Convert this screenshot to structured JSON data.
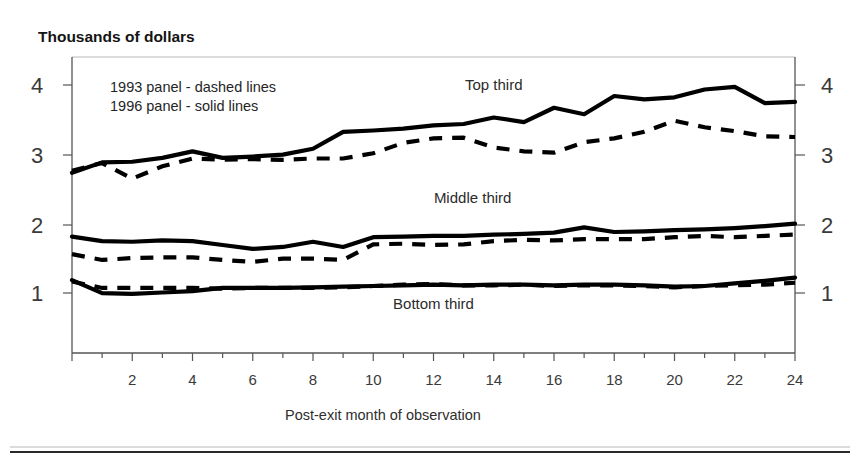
{
  "chart_data": {
    "type": "line",
    "title": "",
    "ylabel": "Thousands of dollars",
    "xlabel": "Post-exit month of observation",
    "xlim": [
      0,
      24
    ],
    "ylim": [
      0,
      4.55
    ],
    "grid": false,
    "legend_position": "inside-top-left",
    "xticks": [
      2,
      4,
      6,
      8,
      10,
      12,
      14,
      16,
      18,
      20,
      22,
      24
    ],
    "xtick_labels": [
      "2",
      "4",
      "6",
      "8",
      "10",
      "12",
      "14",
      "16",
      "18",
      "20",
      "22",
      "24"
    ],
    "yticks": [
      1,
      2,
      3,
      4
    ],
    "ytick_labels": [
      "1",
      "2",
      "3",
      "4"
    ],
    "ytick_labels_right": [
      "1",
      "2",
      "3",
      "4"
    ],
    "x": [
      0,
      1,
      2,
      3,
      4,
      5,
      6,
      7,
      8,
      9,
      10,
      11,
      12,
      13,
      14,
      15,
      16,
      17,
      18,
      19,
      20,
      21,
      22,
      23,
      24
    ],
    "annotations": [
      {
        "text": "Top third",
        "x": 14.0,
        "y": 4.05
      },
      {
        "text": "Middle third",
        "x": 13.3,
        "y": 2.3
      },
      {
        "text": "Bottom third",
        "x": 12.0,
        "y": 0.68
      }
    ],
    "legend_entries": [
      "1993 panel - dashed lines",
      "1996 panel - solid lines"
    ],
    "series": [
      {
        "name": "Top third - 1996 panel (solid)",
        "group": "Top third",
        "panel": "1996",
        "style": "solid",
        "values": [
          2.77,
          2.93,
          2.94,
          3.0,
          3.1,
          3.0,
          3.02,
          3.05,
          3.14,
          3.4,
          3.42,
          3.45,
          3.5,
          3.52,
          3.62,
          3.55,
          3.77,
          3.67,
          3.95,
          3.9,
          3.93,
          4.05,
          4.09,
          3.84,
          3.86
        ]
      },
      {
        "name": "Top third - 1993 panel (dashed)",
        "group": "Top third",
        "panel": "1993",
        "style": "dashed",
        "values": [
          2.8,
          2.92,
          2.68,
          2.87,
          2.99,
          2.97,
          2.98,
          2.97,
          2.99,
          2.99,
          3.07,
          3.23,
          3.3,
          3.31,
          3.16,
          3.1,
          3.08,
          3.24,
          3.3,
          3.4,
          3.57,
          3.47,
          3.41,
          3.33,
          3.32
        ]
      },
      {
        "name": "Middle third - 1996 panel (solid)",
        "group": "Middle third",
        "panel": "1996",
        "style": "solid",
        "values": [
          1.79,
          1.72,
          1.71,
          1.73,
          1.72,
          1.66,
          1.6,
          1.63,
          1.71,
          1.63,
          1.78,
          1.79,
          1.8,
          1.8,
          1.82,
          1.83,
          1.85,
          1.93,
          1.86,
          1.87,
          1.89,
          1.9,
          1.92,
          1.95,
          1.99
        ]
      },
      {
        "name": "Middle third - 1993 panel (dashed)",
        "group": "Middle third",
        "panel": "1993",
        "style": "dashed",
        "values": [
          1.52,
          1.43,
          1.46,
          1.47,
          1.47,
          1.43,
          1.4,
          1.45,
          1.45,
          1.43,
          1.67,
          1.68,
          1.66,
          1.67,
          1.72,
          1.74,
          1.73,
          1.75,
          1.75,
          1.75,
          1.78,
          1.8,
          1.78,
          1.8,
          1.82
        ]
      },
      {
        "name": "Bottom third - 1996 panel (solid)",
        "group": "Bottom third",
        "panel": "1996",
        "style": "solid",
        "values": [
          1.12,
          0.92,
          0.91,
          0.93,
          0.95,
          1.0,
          1.0,
          1.0,
          1.01,
          1.02,
          1.03,
          1.04,
          1.05,
          1.04,
          1.05,
          1.05,
          1.04,
          1.05,
          1.05,
          1.04,
          1.02,
          1.03,
          1.07,
          1.11,
          1.16
        ]
      },
      {
        "name": "Bottom third - 1993 panel (dashed)",
        "group": "Bottom third",
        "panel": "1993",
        "style": "dashed",
        "values": [
          1.1,
          1.0,
          1.0,
          1.0,
          1.0,
          0.99,
          1.0,
          1.0,
          1.0,
          1.01,
          1.03,
          1.05,
          1.06,
          1.04,
          1.04,
          1.05,
          1.03,
          1.04,
          1.04,
          1.03,
          1.01,
          1.03,
          1.04,
          1.05,
          1.08
        ]
      }
    ]
  },
  "colors": {
    "line": "#000000",
    "axis": "#555555",
    "text": "#2b2b2b",
    "background": "#ffffff"
  }
}
